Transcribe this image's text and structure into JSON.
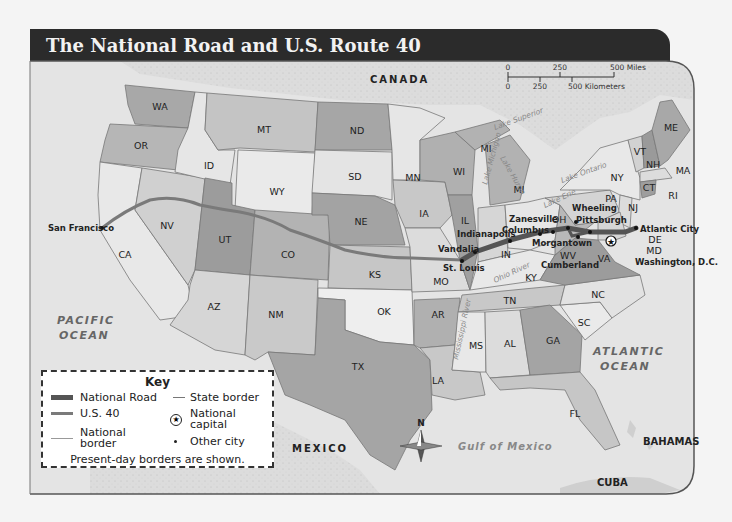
{
  "title": "The National Road and U.S. Route 40",
  "colors": {
    "title_bg": "#2b2b2b",
    "ocean": "#e3e3e3",
    "land_foreign": "#d9d9d9",
    "state_light": "#e6e6e6",
    "state_mid": "#c4c4c4",
    "state_dark": "#a0a0a0",
    "national_road": "#555555",
    "us40": "#7a7a7a"
  },
  "scale": {
    "miles": {
      "ticks": [
        "0",
        "250",
        "500 Miles"
      ]
    },
    "kilometers": {
      "ticks": [
        "0",
        "250",
        "500 Kilometers"
      ]
    }
  },
  "countries": [
    "CANADA",
    "MEXICO",
    "BAHAMAS",
    "CUBA"
  ],
  "oceans": [
    "PACIFIC OCEAN",
    "ATLANTIC OCEAN"
  ],
  "water_bodies": [
    "Gulf of Mexico",
    "Lake Superior",
    "Lake Michigan",
    "Lake Huron",
    "Lake Ontario",
    "Lake Erie",
    "Ohio River",
    "Mississippi River"
  ],
  "states": [
    "WA",
    "OR",
    "CA",
    "NV",
    "ID",
    "MT",
    "WY",
    "UT",
    "CO",
    "AZ",
    "NM",
    "ND",
    "SD",
    "NE",
    "KS",
    "OK",
    "TX",
    "MN",
    "IA",
    "MO",
    "AR",
    "LA",
    "WI",
    "IL",
    "MI",
    "IN",
    "OH",
    "KY",
    "TN",
    "MS",
    "AL",
    "GA",
    "FL",
    "SC",
    "NC",
    "VA",
    "WV",
    "PA",
    "NY",
    "VT",
    "NH",
    "ME",
    "MA",
    "CT",
    "RI",
    "NJ",
    "DE",
    "MD"
  ],
  "cities": [
    "San Francisco",
    "Vandalia",
    "St. Louis",
    "Indianapolis",
    "Columbus",
    "Zanesville",
    "Wheeling",
    "Pittsburgh",
    "Morgantown",
    "Cumberland",
    "Atlantic City",
    "Washington, D.C."
  ],
  "compass": {
    "label": "N"
  },
  "key": {
    "title": "Key",
    "items": [
      {
        "symbol": "thick-line",
        "label": "National Road"
      },
      {
        "symbol": "thin-line",
        "label": "State border"
      },
      {
        "symbol": "medium-line",
        "label": "U.S. 40"
      },
      {
        "symbol": "star-circle",
        "label": "National capital"
      },
      {
        "symbol": "hairline",
        "label": "National border"
      },
      {
        "symbol": "dot",
        "label": "Other city"
      }
    ],
    "note": "Present-day borders are shown."
  }
}
